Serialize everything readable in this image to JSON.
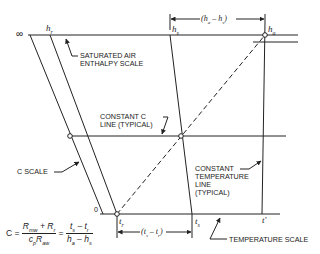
{
  "diagram": {
    "labels": {
      "infinity": "∞",
      "zero": "0",
      "h_r": "hr",
      "h_s": "hs",
      "h_a": "ha",
      "t_r": "tr",
      "t_s": "ts",
      "t_prime": "t'",
      "dim_top": "(ha − hs)",
      "dim_bottom": "(ts − tr)"
    },
    "callouts": {
      "saturated_air_line1": "SATURATED AIR",
      "saturated_air_line2": "ENTHALPY SCALE",
      "constant_c_line1": "CONSTANT C",
      "constant_c_line2": "LINE (TYPICAL)",
      "c_scale": "C SCALE",
      "constant_temp_line1": "CONSTANT",
      "constant_temp_line2": "TEMPERATURE",
      "constant_temp_line3": "LINE",
      "constant_temp_line4": "(TYPICAL)",
      "temperature_scale": "TEMPERATURE SCALE"
    },
    "equation": {
      "lhs": "C =",
      "frac1_num": "Rmw + Rr",
      "frac1_den": "cpRaw",
      "equals": "=",
      "frac2_num": "ts − tr",
      "frac2_den": "ha − hs"
    },
    "colors": {
      "line": "#222222",
      "background": "#ffffff"
    }
  }
}
